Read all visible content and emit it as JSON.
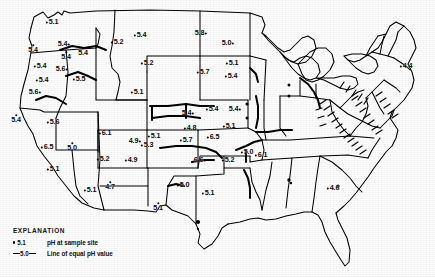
{
  "figure": {
    "kind": "map",
    "background_color": "#ffffff",
    "ink_color": "#000000"
  },
  "legend": {
    "title": "EXPLANATION",
    "rows": [
      {
        "key_type": "dot",
        "key_label": "5.1",
        "description": "pH at sample site"
      },
      {
        "key_type": "line",
        "key_label": "5.0",
        "description": "Line of equal pH value"
      }
    ]
  },
  "chart_data": {
    "type": "scatter",
    "title": "pH at sample site",
    "xlabel": "",
    "ylabel": "",
    "value_label": "pH",
    "points": [
      {
        "label": "5.1",
        "value": 5.1,
        "x": 52,
        "y": 22,
        "place": "western-washington"
      },
      {
        "label": "5.4",
        "value": 5.4,
        "x": 64,
        "y": 44,
        "place": "eastern-washington",
        "dot": "after"
      },
      {
        "label": "5.4",
        "value": 5.4,
        "x": 33,
        "y": 49,
        "place": "northwest-oregon-coast",
        "dot": "below"
      },
      {
        "label": "5.4",
        "value": 5.4,
        "x": 66,
        "y": 56,
        "place": "north-oregon",
        "dot": "below"
      },
      {
        "label": "5.4",
        "value": 5.4,
        "x": 83,
        "y": 52,
        "place": "west-idaho",
        "dot": "below"
      },
      {
        "label": "5.4",
        "value": 5.4,
        "x": 40,
        "y": 66,
        "place": "central-oregon"
      },
      {
        "label": "5.6",
        "value": 5.6,
        "x": 62,
        "y": 69,
        "place": "southeast-oregon",
        "dot": "after"
      },
      {
        "label": "5.4",
        "value": 5.4,
        "x": 42,
        "y": 80,
        "place": "south-oregon"
      },
      {
        "label": "5.5",
        "value": 5.5,
        "x": 79,
        "y": 79,
        "place": "southern-idaho"
      },
      {
        "label": "5.6",
        "value": 5.6,
        "x": 35,
        "y": 92,
        "place": "north-california",
        "dot": "after"
      },
      {
        "label": "5.4",
        "value": 5.4,
        "x": 16,
        "y": 119,
        "place": "northwest-california-coast",
        "dot": "below"
      },
      {
        "label": "5.6",
        "value": 5.6,
        "x": 53,
        "y": 122,
        "place": "north-nevada"
      },
      {
        "label": "6.5",
        "value": 6.5,
        "x": 47,
        "y": 147,
        "place": "central-california"
      },
      {
        "label": "5.0",
        "value": 5.0,
        "x": 72,
        "y": 147,
        "place": "south-nevada",
        "dot": "below"
      },
      {
        "label": "5.1",
        "value": 5.1,
        "x": 53,
        "y": 169,
        "place": "southern-california"
      },
      {
        "label": "5.1",
        "value": 5.1,
        "x": 90,
        "y": 190,
        "place": "southwest-arizona"
      },
      {
        "label": "4.7",
        "value": 4.7,
        "x": 110,
        "y": 186,
        "place": "central-arizona",
        "dot": "below"
      },
      {
        "label": "6.1",
        "value": 6.1,
        "x": 105,
        "y": 133,
        "place": "north-arizona-utah"
      },
      {
        "label": "5.2",
        "value": 5.2,
        "x": 103,
        "y": 159,
        "place": "southeast-arizona"
      },
      {
        "label": "5.2",
        "value": 5.2,
        "x": 117,
        "y": 42,
        "place": "west-montana"
      },
      {
        "label": "5.4",
        "value": 5.4,
        "x": 140,
        "y": 35,
        "place": "central-montana"
      },
      {
        "label": "5.2",
        "value": 5.2,
        "x": 147,
        "y": 63,
        "place": "southeast-montana"
      },
      {
        "label": "5.1",
        "value": 5.1,
        "x": 137,
        "y": 92,
        "place": "central-wyoming"
      },
      {
        "label": "5.1",
        "value": 5.1,
        "x": 154,
        "y": 136,
        "place": "north-colorado"
      },
      {
        "label": "4.9",
        "value": 4.9,
        "x": 135,
        "y": 141,
        "place": "central-colorado",
        "dot": "after"
      },
      {
        "label": "5.3",
        "value": 5.3,
        "x": 147,
        "y": 145,
        "place": "east-colorado"
      },
      {
        "label": "4.9",
        "value": 4.9,
        "x": 131,
        "y": 160,
        "place": "new-mexico-north"
      },
      {
        "label": "5.1",
        "value": 5.1,
        "x": 158,
        "y": 207,
        "place": "west-texas",
        "dot": "below"
      },
      {
        "label": "5.0",
        "value": 5.0,
        "x": 183,
        "y": 185,
        "place": "texas-panhandle"
      },
      {
        "label": "5.1",
        "value": 5.1,
        "x": 208,
        "y": 193,
        "place": "central-texas"
      },
      {
        "label": "5.8",
        "value": 5.8,
        "x": 201,
        "y": 33,
        "place": "north-dakota",
        "dot": "after"
      },
      {
        "label": "5.0",
        "value": 5.0,
        "x": 228,
        "y": 43,
        "place": "northeast-dakota",
        "dot": "after"
      },
      {
        "label": "5.7",
        "value": 5.7,
        "x": 203,
        "y": 72,
        "place": "south-dakota"
      },
      {
        "label": "5.1",
        "value": 5.1,
        "x": 232,
        "y": 63,
        "place": "southeast-minnesota"
      },
      {
        "label": "5.4",
        "value": 5.4,
        "x": 231,
        "y": 76,
        "place": "iowa-north"
      },
      {
        "label": "5.4",
        "value": 5.4,
        "x": 188,
        "y": 113,
        "place": "nebraska-west",
        "dot": "after"
      },
      {
        "label": "5.4",
        "value": 5.4,
        "x": 212,
        "y": 109,
        "place": "nebraska-east"
      },
      {
        "label": "5.4",
        "value": 5.4,
        "x": 235,
        "y": 109,
        "place": "iowa-west",
        "dot": "after"
      },
      {
        "label": "4.8",
        "value": 4.8,
        "x": 190,
        "y": 128,
        "place": "kansas-west"
      },
      {
        "label": "5.1",
        "value": 5.1,
        "x": 229,
        "y": 126,
        "place": "iowa-missouri"
      },
      {
        "label": "5.7",
        "value": 5.7,
        "x": 186,
        "y": 140,
        "place": "kansas-central"
      },
      {
        "label": "6.5",
        "value": 6.5,
        "x": 213,
        "y": 137,
        "place": "missouri-west"
      },
      {
        "label": "6.6",
        "value": 6.6,
        "x": 200,
        "y": 160,
        "place": "oklahoma-north",
        "dot": "after"
      },
      {
        "label": "5.2",
        "value": 5.2,
        "x": 228,
        "y": 160,
        "place": "missouri-south"
      },
      {
        "label": "5.0",
        "value": 5.0,
        "x": 247,
        "y": 152,
        "place": "illinois"
      },
      {
        "label": "6.1",
        "value": 6.1,
        "x": 261,
        "y": 155,
        "place": "indiana"
      },
      {
        "label": "4.4",
        "value": 4.4,
        "x": 406,
        "y": 66,
        "place": "new-england-coast",
        "dot": "before"
      },
      {
        "label": "4.6",
        "value": 4.6,
        "x": 333,
        "y": 188,
        "place": "southeast-alabama-georgia",
        "dot": "before"
      }
    ],
    "contour_label": "5.0"
  }
}
